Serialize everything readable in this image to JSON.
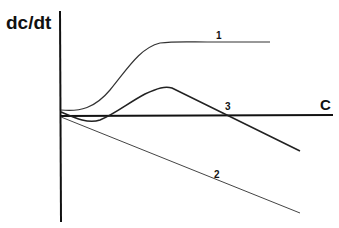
{
  "diagram": {
    "y_axis_label": "dc/dt",
    "x_axis_label": "C",
    "curves": [
      {
        "id": "1",
        "label": "1",
        "description": "sigmoidal rise to a plateau"
      },
      {
        "id": "2",
        "label": "2",
        "description": "straight line decreasing from origin"
      },
      {
        "id": "3",
        "label": "3",
        "description": "dips below axis, rises to a peak, then declines crossing the C axis"
      }
    ],
    "colors": {
      "line": "#222222",
      "background": "#ffffff"
    }
  }
}
